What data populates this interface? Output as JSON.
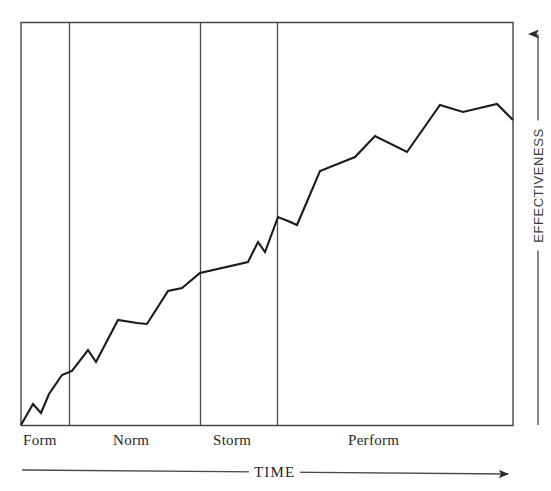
{
  "chart_data": {
    "type": "line",
    "title": "",
    "subtitle": "",
    "xlabel": "TIME",
    "ylabel": "EFFECTIVENESS",
    "xlim": [
      0,
      100
    ],
    "ylim": [
      0,
      100
    ],
    "grid": false,
    "legend": null,
    "axis_arrows": {
      "x": "right",
      "y": "up"
    },
    "stage_labels": [
      "Form",
      "Norm",
      "Storm",
      "Perform"
    ],
    "stage_boundaries_pct": [
      0,
      9.8,
      36.4,
      52.0,
      100
    ],
    "annotations": [],
    "series": [
      {
        "name": "Team effectiveness",
        "color": "#1a1a1a",
        "points_px": [
          [
            21,
            425
          ],
          [
            33,
            404
          ],
          [
            41,
            413
          ],
          [
            49,
            394
          ],
          [
            62,
            375
          ],
          [
            72,
            371
          ],
          [
            88,
            350
          ],
          [
            96,
            362
          ],
          [
            118,
            320
          ],
          [
            137,
            323
          ],
          [
            147,
            324
          ],
          [
            168,
            291
          ],
          [
            182,
            288
          ],
          [
            200,
            273
          ],
          [
            248,
            262
          ],
          [
            258,
            242
          ],
          [
            265,
            252
          ],
          [
            278,
            217
          ],
          [
            288,
            221
          ],
          [
            297,
            225
          ],
          [
            320,
            171
          ],
          [
            355,
            157
          ],
          [
            375,
            136
          ],
          [
            407,
            152
          ],
          [
            440,
            105
          ],
          [
            463,
            112
          ],
          [
            497,
            104
          ],
          [
            513,
            120
          ]
        ],
        "x": [
          0.0,
          2.4,
          4.1,
          5.7,
          8.3,
          10.4,
          13.6,
          15.2,
          19.7,
          23.6,
          25.6,
          29.9,
          32.7,
          36.4,
          46.1,
          48.2,
          49.6,
          52.2,
          54.3,
          56.1,
          60.8,
          68.1,
          72.4,
          78.9,
          85.6,
          90.3,
          97.2,
          100.0
        ],
        "y": [
          0.0,
          5.2,
          3.0,
          7.7,
          12.4,
          13.4,
          18.6,
          15.6,
          26.0,
          25.2,
          25.0,
          33.2,
          33.9,
          37.6,
          40.3,
          45.3,
          42.8,
          51.5,
          50.5,
          49.5,
          62.9,
          66.3,
          71.5,
          67.6,
          79.2,
          77.5,
          79.5,
          75.5
        ]
      }
    ]
  },
  "axes": {
    "x_axis": {
      "label": "TIME",
      "arrow_direction": "right"
    },
    "y_axis": {
      "label": "EFFECTIVENESS",
      "arrow_direction": "up"
    }
  },
  "stages": [
    {
      "id": "form",
      "label": "Form"
    },
    {
      "id": "norm",
      "label": "Norm"
    },
    {
      "id": "storm",
      "label": "Storm"
    },
    {
      "id": "perform",
      "label": "Perform"
    }
  ],
  "colors": {
    "line": "#1a1a1a",
    "frame": "#3f3f3f",
    "divider": "#4a4a4a",
    "axis": "#4a4a4a",
    "background": "#ffffff",
    "text": "#262626"
  }
}
